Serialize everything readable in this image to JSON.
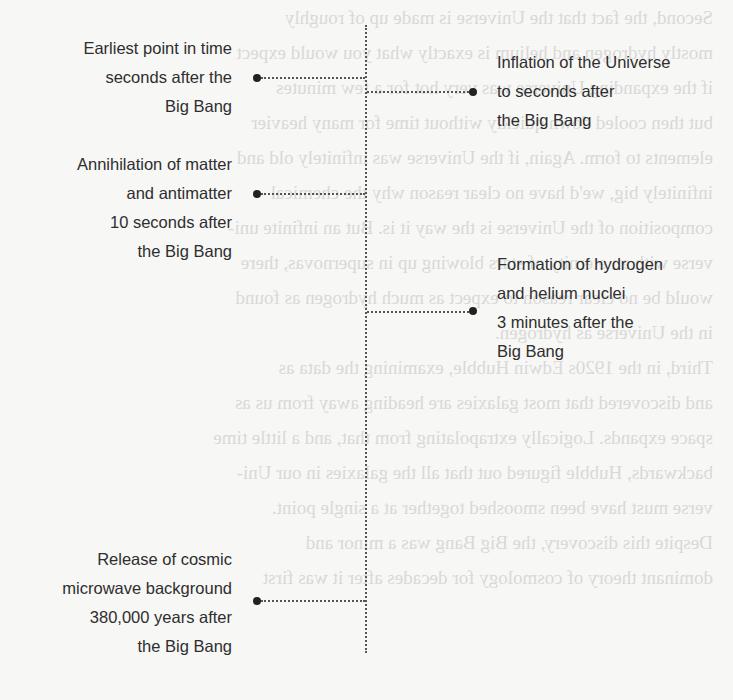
{
  "timeline": {
    "events": [
      {
        "side": "left",
        "lines": [
          "Earliest point in time",
          "seconds after the",
          "Big Bang"
        ]
      },
      {
        "side": "right",
        "lines": [
          "Inflation of the Universe",
          "to  seconds after",
          "the Big Bang"
        ]
      },
      {
        "side": "left",
        "lines": [
          "Annihilation of matter",
          "and antimatter",
          "10 seconds after",
          "the Big Bang"
        ]
      },
      {
        "side": "right",
        "lines": [
          "Formation of hydrogen",
          "and helium nuclei",
          "3 minutes after the",
          "Big Bang"
        ]
      },
      {
        "side": "left",
        "lines": [
          "Release of cosmic",
          "microwave background",
          "380,000 years after",
          "the Big Bang"
        ]
      }
    ]
  },
  "background_bleed": {
    "lines": [
      "Second, the fact that the Universe is made up of roughly",
      "mostly hydrogen and helium is exactly what you would expect",
      "if the expanding Universe was very hot for a few minutes",
      "but then cooled down quickly without time for many heavier",
      "elements to form. Again, if the Universe was infinitely old and",
      "infinitely big, we'd have no clear reason why the chemical",
      "composition of the Universe is the way it is. But an infinite uni-",
      "verse with an eternity of stars blowing up in supernovas, there",
      "would be no clear reason to expect as much hydrogen as found",
      "in the Universe as hydrogen.",
      "   Third, in the 1920s Edwin Hubble, examining the data as",
      "and discovered that most galaxies are heading away from us as",
      "space expands. Logically extrapolating from that, and a little time",
      "backwards, Hubble figured out that all the galaxies in our Uni-",
      "verse must have been smooshed together at a single point.",
      "   Despite this discovery, the Big Bang was a minor and",
      "dominant theory of cosmology for decades after it was first"
    ]
  },
  "colors": {
    "background": "#f7f7f6",
    "text": "#2e2e2e",
    "line": "#555555",
    "dot": "#222222",
    "bleed_text": "#d9d9d6"
  }
}
